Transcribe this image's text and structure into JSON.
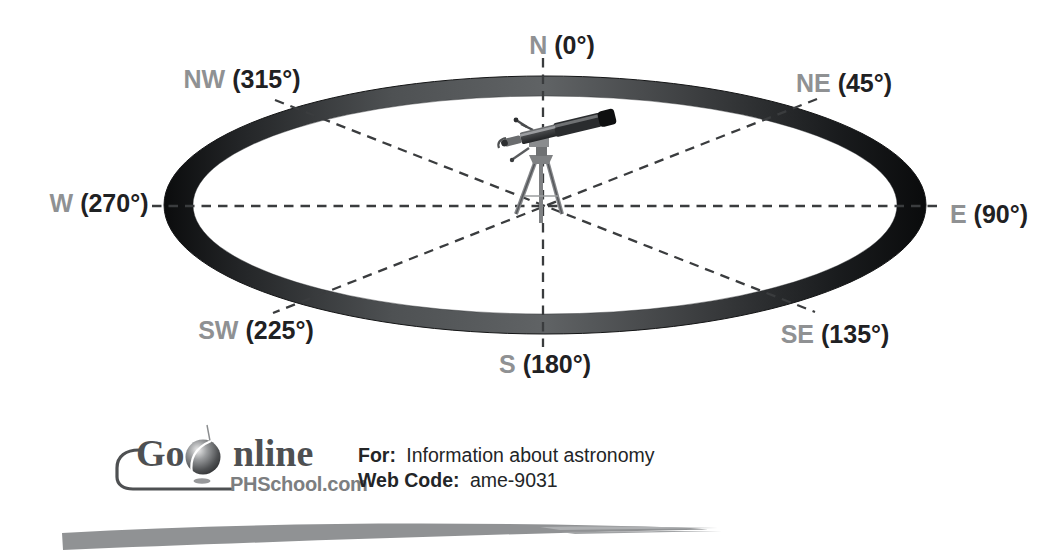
{
  "compass": {
    "n": {
      "dir": "N",
      "deg": "(0°)"
    },
    "ne": {
      "dir": "NE",
      "deg": "(45°)"
    },
    "e": {
      "dir": "E",
      "deg": "(90°)"
    },
    "se": {
      "dir": "SE",
      "deg": "(135°)"
    },
    "s": {
      "dir": "S",
      "deg": "(180°)"
    },
    "sw": {
      "dir": "SW",
      "deg": "(225°)"
    },
    "w": {
      "dir": "W",
      "deg": "(270°)"
    },
    "nw": {
      "dir": "NW",
      "deg": "(315°)"
    }
  },
  "colors": {
    "direction_label_gray": "#8f9193",
    "degree_label_black": "#1f2123",
    "ring_mid_gray": "#606365",
    "ring_dark": "#0b0c0d",
    "dashed_line": "#3a3c3e",
    "logo_text": "#4e5052",
    "phschool_gray": "#7c7e80",
    "swoosh_gray": "#909294"
  },
  "go_online": {
    "go": "Go",
    "nline": "nline",
    "site": "PHSchool.com",
    "for_label": "For:",
    "for_value": "Information about astronomy",
    "web_code_label": "Web Code:",
    "web_code_value": "ame-9031"
  }
}
